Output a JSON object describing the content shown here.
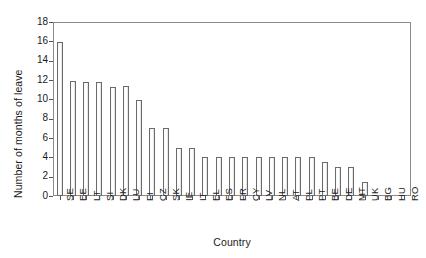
{
  "chart_data": {
    "type": "bar",
    "title": "",
    "xlabel": "Country",
    "ylabel": "Number of months of leave",
    "categories": [
      "SE",
      "EE",
      "LT",
      "SI",
      "DK",
      "LU",
      "FI",
      "CZ",
      "SK",
      "IE",
      "IT",
      "EL",
      "ES",
      "FR",
      "CY",
      "LV",
      "NL",
      "AT",
      "PL",
      "PT",
      "BE",
      "DE",
      "MT",
      "UK",
      "BG",
      "HU",
      "RO"
    ],
    "values": [
      15.9,
      11.9,
      11.8,
      11.8,
      11.3,
      11.4,
      9.9,
      7.0,
      7.0,
      5.0,
      5.0,
      4.0,
      4.0,
      4.0,
      4.0,
      4.0,
      4.0,
      4.0,
      4.0,
      4.0,
      3.5,
      3.0,
      3.0,
      1.5,
      0,
      0,
      0
    ],
    "ylim": [
      0,
      18
    ],
    "ytick_values": [
      0,
      2,
      4,
      6,
      8,
      10,
      12,
      14,
      16,
      18
    ],
    "ytick_labels": [
      "0",
      "2",
      "4",
      "6",
      "8",
      "10",
      "12",
      "14",
      "16",
      "18"
    ],
    "grid": false,
    "legend": null,
    "bar_fill_color": "#ffffff",
    "bar_edge_color": "#6b6b6b",
    "axis_color": "#8a8a8a"
  }
}
